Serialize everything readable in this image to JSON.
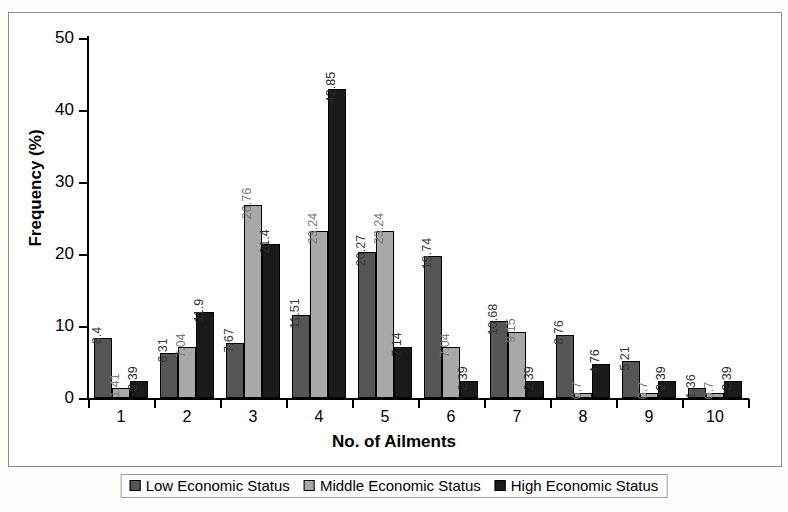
{
  "chart_data": {
    "type": "bar",
    "title": "",
    "xlabel": "No. of Ailments",
    "ylabel": "Frequency (%)",
    "categories": [
      "1",
      "2",
      "3",
      "4",
      "5",
      "6",
      "7",
      "8",
      "9",
      "10"
    ],
    "ylim": [
      0,
      50
    ],
    "ytick_labels": [
      "0",
      "10",
      "20",
      "30",
      "40",
      "50"
    ],
    "ytick_values": [
      0,
      10,
      20,
      30,
      40,
      50
    ],
    "grid": false,
    "legend_position": "bottom",
    "data_labels": true,
    "series": [
      {
        "name": "Low Economic Status",
        "color": "#555555",
        "values": [
          8.4,
          6.31,
          7.67,
          11.51,
          20.27,
          19.74,
          10.68,
          8.76,
          5.21,
          1.36
        ],
        "labels": [
          "8.4",
          "6.31",
          "7.67",
          "11.51",
          "20.27",
          "19.74",
          "10.68",
          "8.76",
          "5.21",
          "1.36"
        ]
      },
      {
        "name": "Middle Economic Status",
        "color": "#a8a8a8",
        "values": [
          1.41,
          7.04,
          26.76,
          23.24,
          23.24,
          7.04,
          9.15,
          0.7,
          0.7,
          0.7
        ],
        "labels": [
          "1.41",
          "7.04",
          "26.76",
          "23.24",
          "23.24",
          "7.04",
          "9.15",
          "0.7",
          "0.7",
          "0.7"
        ]
      },
      {
        "name": "High Economic Status",
        "color": "#1a1a1a",
        "values": [
          2.39,
          11.9,
          21.4,
          42.85,
          7.14,
          2.39,
          2.39,
          4.76,
          2.39,
          2.39
        ],
        "labels": [
          "2.39",
          "11.9",
          "21.4",
          "42.85",
          "7.14",
          "2.39",
          "2.39",
          "4.76",
          "2.39",
          "2.39"
        ]
      }
    ]
  }
}
